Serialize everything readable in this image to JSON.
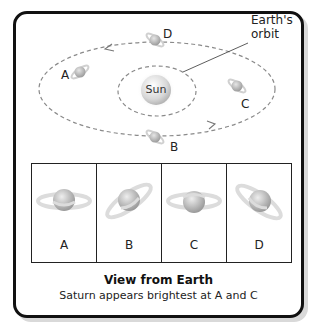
{
  "diagram": {
    "sun_label": "Sun",
    "earth_orbit_label_line1": "Earth's",
    "earth_orbit_label_line2": "orbit",
    "positions": [
      {
        "id": "A",
        "label": "A"
      },
      {
        "id": "B",
        "label": "B"
      },
      {
        "id": "C",
        "label": "C"
      },
      {
        "id": "D",
        "label": "D"
      }
    ],
    "orbit_direction": "counterclockwise-arrows"
  },
  "panels": {
    "items": [
      {
        "label": "A",
        "ring_tilt": "edge-on horizontal"
      },
      {
        "label": "B",
        "ring_tilt": "tilted rising to right"
      },
      {
        "label": "C",
        "ring_tilt": "edge-on horizontal"
      },
      {
        "label": "D",
        "ring_tilt": "tilted falling to right"
      }
    ]
  },
  "caption": {
    "title": "View from Earth",
    "subtitle": "Saturn appears brightest at A and C"
  },
  "colors": {
    "frame": "#111111",
    "orbit_dash": "#8a8a8a",
    "planet": "#b8b8b8",
    "ring": "#e2e2e2"
  }
}
